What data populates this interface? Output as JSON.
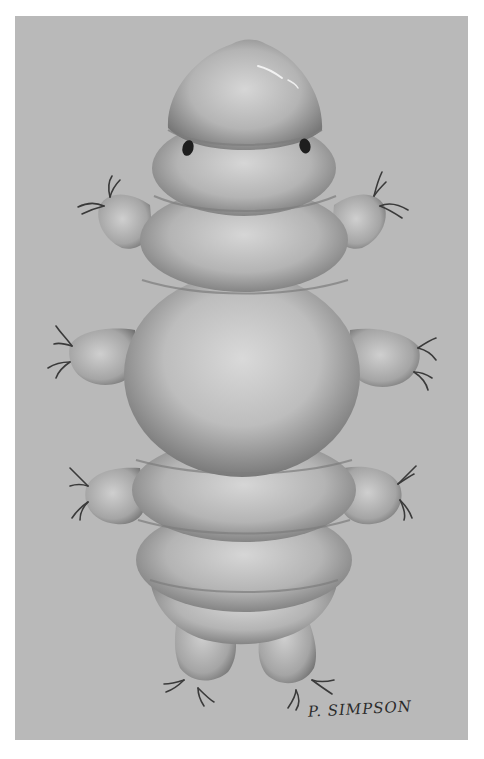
{
  "illustration": {
    "subject": "Tardigrade (water bear), dorsal view",
    "style": "grayscale airbrush illustration",
    "signature": "P. SIMPSON",
    "colors": {
      "page_background": "#ffffff",
      "panel_background": "#b9b9b9",
      "body_light": "#d4d4d4",
      "body_mid": "#a9a9a9",
      "body_shadow": "#6e6e6e",
      "eye": "#1e1e1e",
      "claw": "#3a3a3a",
      "signature_ink": "#2b2b2b"
    },
    "features": {
      "body_segments": 6,
      "leg_pairs": 4,
      "eyes": 2
    }
  }
}
